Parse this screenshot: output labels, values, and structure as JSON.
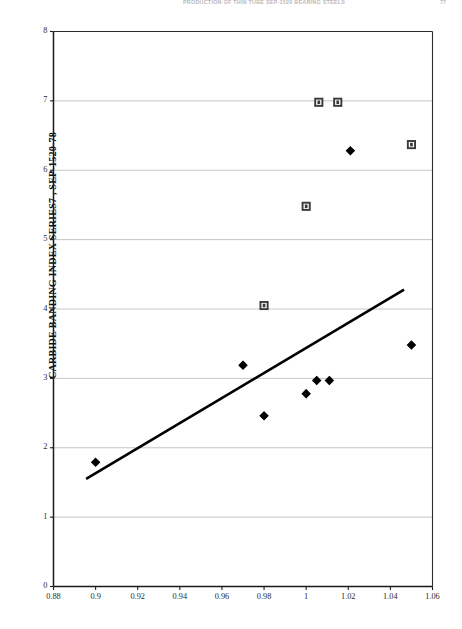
{
  "header": {
    "running_title": "PRODUCTION OF THIN TUBE SEP-1520 BEARING STEELS",
    "folio": "77"
  },
  "chart_data": {
    "type": "scatter",
    "title": "",
    "xlabel": "",
    "ylabel": "CARBIDE BANDING INDEX SERIES7 , SEP-1520-78",
    "xlim": [
      0.88,
      1.06
    ],
    "ylim": [
      0,
      8
    ],
    "xticks": [
      "0.88",
      "0.9",
      "0.92",
      "0.94",
      "0.96",
      "0.98",
      "1",
      "1.02",
      "1.04",
      "1.06"
    ],
    "xtick_values": [
      0.88,
      0.9,
      0.92,
      0.94,
      0.96,
      0.98,
      1.0,
      1.02,
      1.04,
      1.06
    ],
    "yticks": [
      "0",
      "1",
      "2",
      "3",
      "4",
      "5",
      "6",
      "7",
      "8"
    ],
    "ytick_values": [
      0,
      1,
      2,
      3,
      4,
      5,
      6,
      7,
      8
    ],
    "grid": "horizontal",
    "legend": "none",
    "series": [
      {
        "name": "Series 1",
        "marker": "filled-diamond",
        "color": "#000000",
        "points": [
          {
            "x": 0.9,
            "y": 1.79
          },
          {
            "x": 0.97,
            "y": 3.19
          },
          {
            "x": 0.98,
            "y": 2.46
          },
          {
            "x": 1.0,
            "y": 2.78
          },
          {
            "x": 1.005,
            "y": 2.97
          },
          {
            "x": 1.011,
            "y": 2.97
          },
          {
            "x": 1.021,
            "y": 6.28
          },
          {
            "x": 1.05,
            "y": 3.48
          }
        ]
      },
      {
        "name": "Series 2",
        "marker": "open-square",
        "color": "#3a3a3a",
        "points": [
          {
            "x": 0.98,
            "y": 4.05
          },
          {
            "x": 1.0,
            "y": 5.48
          },
          {
            "x": 1.006,
            "y": 6.98
          },
          {
            "x": 1.015,
            "y": 6.98
          },
          {
            "x": 1.05,
            "y": 6.37
          }
        ]
      }
    ],
    "trendline": {
      "name": "linear-trend",
      "color": "#000000",
      "x0": 0.8955,
      "y0": 1.55,
      "x1": 1.0465,
      "y1": 4.28
    }
  }
}
